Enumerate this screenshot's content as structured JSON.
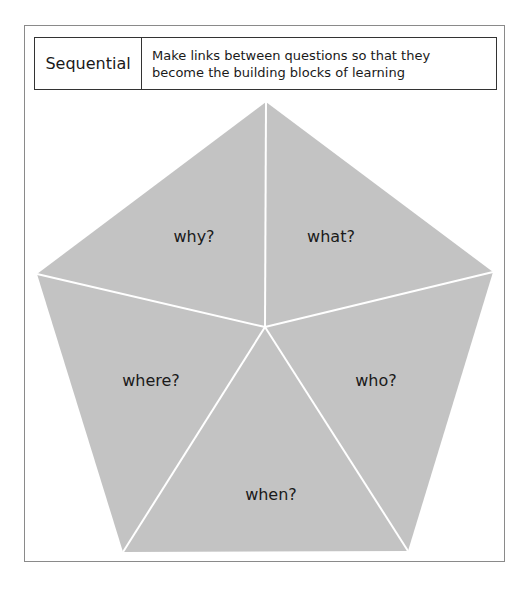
{
  "header": {
    "term": "Sequential",
    "description": "Make links between questions so that they become the building blocks of learning"
  },
  "diagram": {
    "shape": "pentagon",
    "fill_color": "#c3c3c3",
    "divider_color": "#ffffff",
    "segments": [
      {
        "id": "why",
        "label": "why?"
      },
      {
        "id": "what",
        "label": "what?"
      },
      {
        "id": "who",
        "label": "who?"
      },
      {
        "id": "when",
        "label": "when?"
      },
      {
        "id": "where",
        "label": "where?"
      }
    ]
  }
}
